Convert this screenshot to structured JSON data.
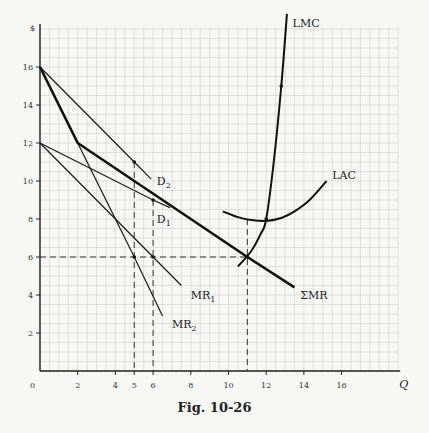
{
  "chart_data": {
    "type": "line",
    "title": "",
    "caption": "Fig. 10-26",
    "xlabel": "Q",
    "ylabel": "$",
    "xlim": [
      0,
      19
    ],
    "ylim": [
      0,
      18
    ],
    "grid": true,
    "grid_step": 0.5,
    "x_ticks": [
      0,
      2,
      4,
      5,
      6,
      8,
      10,
      12,
      14,
      16
    ],
    "y_ticks": [
      2,
      4,
      6,
      8,
      10,
      12,
      14,
      16
    ],
    "series": [
      {
        "name": "D2",
        "label": "D",
        "sub": "2",
        "style": "thin",
        "points": [
          [
            0,
            16
          ],
          [
            5,
            11
          ],
          [
            5.9,
            10.1
          ]
        ],
        "label_at": [
          6.2,
          10
        ]
      },
      {
        "name": "D1",
        "label": "D",
        "sub": "1",
        "style": "thin",
        "points": [
          [
            0,
            12
          ],
          [
            6,
            9
          ],
          [
            6.9,
            8.6
          ]
        ],
        "label_at": [
          6.2,
          8
        ]
      },
      {
        "name": "MR1",
        "label": "MR",
        "sub": "1",
        "style": "thin",
        "points": [
          [
            0,
            12
          ],
          [
            6,
            6
          ],
          [
            7.5,
            4.5
          ]
        ],
        "label_at": [
          8,
          4
        ]
      },
      {
        "name": "MR2",
        "label": "MR",
        "sub": "2",
        "style": "thin",
        "points": [
          [
            0,
            16
          ],
          [
            5,
            6
          ],
          [
            6.5,
            2.9
          ]
        ],
        "label_at": [
          7,
          2.5
        ]
      },
      {
        "name": "ΣMR",
        "label": "ΣMR",
        "sub": "",
        "style": "thick",
        "points": [
          [
            0,
            16
          ],
          [
            2,
            12
          ],
          [
            11,
            6
          ],
          [
            13.5,
            4.4
          ]
        ],
        "label_at": [
          13.8,
          4
        ]
      },
      {
        "name": "LMC",
        "label": "LMC",
        "sub": "",
        "style": "cost",
        "points": [
          [
            10.5,
            5.5
          ],
          [
            11.2,
            6.3
          ],
          [
            11.7,
            7.2
          ],
          [
            12,
            8
          ],
          [
            12.4,
            11
          ],
          [
            12.8,
            15
          ],
          [
            13.1,
            18.8
          ]
        ],
        "label_at": [
          13.4,
          18.3
        ]
      },
      {
        "name": "LAC",
        "label": "LAC",
        "sub": "",
        "style": "cost",
        "points": [
          [
            9.7,
            8.4
          ],
          [
            10.5,
            8.1
          ],
          [
            11.2,
            7.95
          ],
          [
            12,
            7.9
          ],
          [
            12.8,
            8.05
          ],
          [
            13.5,
            8.4
          ],
          [
            14.3,
            9
          ],
          [
            15.2,
            10
          ]
        ],
        "label_at": [
          15.5,
          10.3
        ]
      }
    ],
    "markers": [
      [
        5,
        11
      ],
      [
        6,
        9
      ],
      [
        5,
        6
      ],
      [
        6,
        6
      ],
      [
        11,
        6
      ],
      [
        12.8,
        15
      ],
      [
        12,
        8
      ]
    ],
    "guides": [
      {
        "from": [
          0,
          6
        ],
        "to": [
          11,
          6
        ]
      },
      {
        "from": [
          5,
          11
        ],
        "to": [
          5,
          0
        ]
      },
      {
        "from": [
          6,
          9
        ],
        "to": [
          6,
          0
        ]
      },
      {
        "from": [
          11,
          8
        ],
        "to": [
          11,
          0
        ]
      }
    ]
  }
}
